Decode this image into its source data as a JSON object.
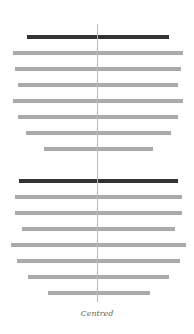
{
  "diagram": {
    "caption": "Centred",
    "colors": {
      "heading": "#333333",
      "line": "#aaaaaa",
      "axis": "#b8b8b8"
    },
    "centre_x": 97,
    "groups": [
      {
        "name": "group-1",
        "bars": [
          {
            "type": "heading",
            "x": 27,
            "w": 142,
            "y": 35
          },
          {
            "type": "line",
            "x": 13,
            "w": 170,
            "y": 51
          },
          {
            "type": "line",
            "x": 15,
            "w": 166,
            "y": 67
          },
          {
            "type": "line",
            "x": 18,
            "w": 160,
            "y": 83
          },
          {
            "type": "line",
            "x": 13,
            "w": 170,
            "y": 99
          },
          {
            "type": "line",
            "x": 18,
            "w": 160,
            "y": 115
          },
          {
            "type": "line",
            "x": 26,
            "w": 145,
            "y": 131
          },
          {
            "type": "line",
            "x": 44,
            "w": 109,
            "y": 147
          }
        ]
      },
      {
        "name": "group-2",
        "bars": [
          {
            "type": "heading",
            "x": 19,
            "w": 159,
            "y": 179
          },
          {
            "type": "line",
            "x": 15,
            "w": 167,
            "y": 195
          },
          {
            "type": "line",
            "x": 15,
            "w": 167,
            "y": 211
          },
          {
            "type": "line",
            "x": 22,
            "w": 153,
            "y": 227
          },
          {
            "type": "line",
            "x": 11,
            "w": 175,
            "y": 243
          },
          {
            "type": "line",
            "x": 17,
            "w": 163,
            "y": 259
          },
          {
            "type": "line",
            "x": 28,
            "w": 141,
            "y": 275
          },
          {
            "type": "line",
            "x": 48,
            "w": 102,
            "y": 291
          }
        ]
      }
    ]
  }
}
